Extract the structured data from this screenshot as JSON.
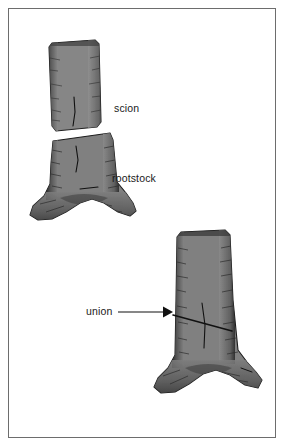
{
  "figure": {
    "background_color": "#ffffff",
    "border_color": "#6d6d6d",
    "trunk_fill": "#808080",
    "trunk_shadow": "#4a4a4a",
    "trunk_outline": "#1c1c1c",
    "text_color": "#1a1a1a",
    "labels": [
      {
        "id": "scion",
        "text": "scion",
        "x": 114,
        "y": 103
      },
      {
        "id": "rootstock",
        "text": "rootstock",
        "x": 112,
        "y": 173
      },
      {
        "id": "union",
        "text": "union",
        "x": 86,
        "y": 306
      }
    ],
    "annotations": {
      "arrow": {
        "name": "union-arrow",
        "from_x": 118,
        "from_y": 312,
        "to_x": 171,
        "to_y": 312,
        "color": "#111111"
      }
    },
    "parts": [
      {
        "id": "scion-trunk",
        "name": "scion-trunk-illustration",
        "description": "upper trunk section with diagonal graft cut at base"
      },
      {
        "id": "rootstock-trunk",
        "name": "rootstock-trunk-illustration",
        "description": "lower trunk with flared root base and diagonal graft cut at top"
      },
      {
        "id": "grafted-trunk",
        "name": "grafted-trunk-illustration",
        "description": "completed graft, scion joined to rootstock at union line"
      }
    ],
    "icons": {
      "arrow_head": "arrow-right-icon"
    }
  }
}
